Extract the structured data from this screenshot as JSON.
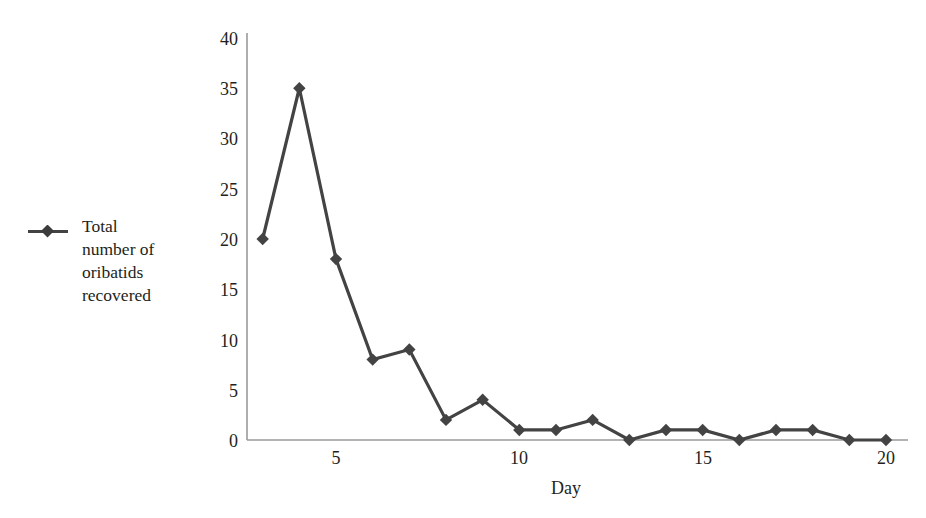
{
  "legend": {
    "label": "Total\nnumber of\noribatids\nrecovered",
    "marker_icon": "diamond-marker-icon",
    "series_color": "#434343"
  },
  "axes": {
    "y_ticks": [
      "40",
      "35",
      "30",
      "25",
      "20",
      "15",
      "10",
      "5",
      "0"
    ],
    "x_ticks": [
      "5",
      "10",
      "15",
      "20"
    ],
    "x_title": "Day",
    "y_title": "",
    "axis_color": "#9a9a9a"
  },
  "chart_data": {
    "type": "line",
    "title": "",
    "xlabel": "Day",
    "ylabel": "",
    "xlim": [
      3,
      20
    ],
    "ylim": [
      0,
      40
    ],
    "grid": false,
    "legend_position": "left-outside",
    "marker": "diamond",
    "line_color": "#434343",
    "x": [
      3,
      4,
      5,
      6,
      7,
      8,
      9,
      10,
      11,
      12,
      13,
      14,
      15,
      16,
      17,
      18,
      19,
      20
    ],
    "series": [
      {
        "name": "Total number of oribatids recovered",
        "values": [
          20,
          35,
          18,
          8,
          9,
          2,
          4,
          1,
          1,
          2,
          0,
          1,
          1,
          0,
          1,
          1,
          0,
          0
        ]
      }
    ],
    "x_tick_values": [
      5,
      10,
      15,
      20
    ],
    "y_tick_values": [
      0,
      5,
      10,
      15,
      20,
      25,
      30,
      35,
      40
    ]
  }
}
